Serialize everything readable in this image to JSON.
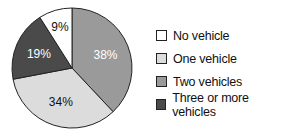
{
  "chart_data": {
    "type": "pie",
    "title": "",
    "categories": [
      "No vehicle",
      "One vehicle",
      "Two vehicles",
      "Three or more vehicles"
    ],
    "values": [
      9,
      34,
      38,
      19
    ],
    "labels": [
      "9%",
      "34%",
      "38%",
      "19%"
    ],
    "colors": [
      "#ffffff",
      "#dcdcdc",
      "#9a9a9a",
      "#4a4a4a"
    ],
    "label_colors": [
      "#111111",
      "#111111",
      "#ffffff",
      "#ffffff"
    ],
    "draw_order": [
      "Two vehicles",
      "One vehicle",
      "Three or more vehicles",
      "No vehicle"
    ],
    "start_angle_deg": 0,
    "direction": "clockwise",
    "legend_position": "right"
  },
  "legend": {
    "items": [
      {
        "label": "No vehicle",
        "color": "#ffffff"
      },
      {
        "label": "One vehicle",
        "color": "#dcdcdc"
      },
      {
        "label": "Two vehicles",
        "color": "#9a9a9a"
      },
      {
        "label": "Three or more vehicles",
        "color": "#4a4a4a"
      }
    ]
  }
}
